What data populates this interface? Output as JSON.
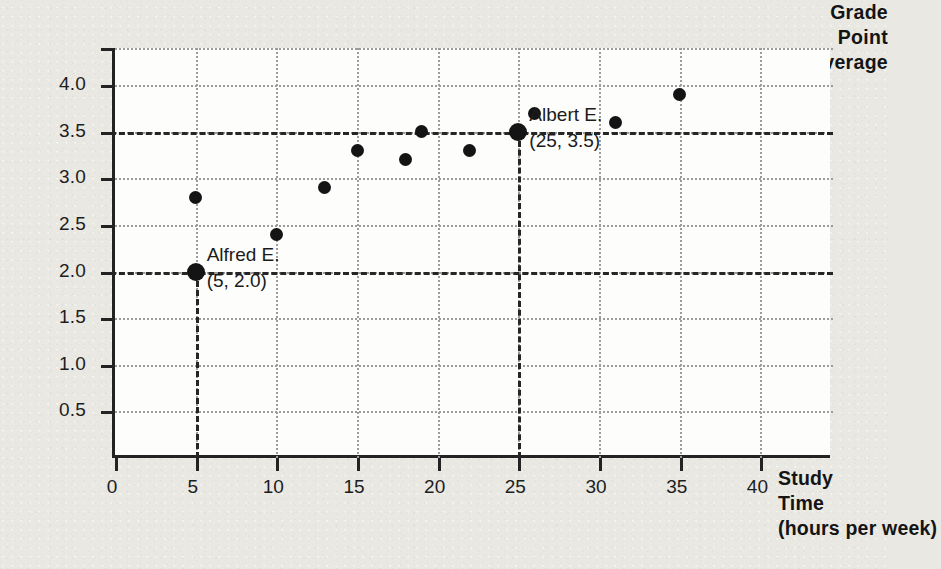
{
  "chart_data": {
    "type": "scatter",
    "title": "",
    "xlabel": "Study Time (hours per week)",
    "ylabel": "Grade Point Average",
    "xlabel_lines": [
      "Study",
      "Time",
      "(hours per week)"
    ],
    "ylabel_lines": [
      "Grade",
      "Point",
      "Average"
    ],
    "xlim": [
      0,
      44.5
    ],
    "ylim": [
      0,
      4.4
    ],
    "xticks": [
      0,
      5,
      10,
      15,
      20,
      25,
      30,
      35,
      40
    ],
    "xticklabels": [
      "0",
      "5",
      "10",
      "15",
      "20",
      "25",
      "30",
      "35",
      "40"
    ],
    "yticks": [
      0.5,
      1.0,
      1.5,
      2.0,
      2.5,
      3.0,
      3.5,
      4.0
    ],
    "yticklabels": [
      "0.5",
      "1.0",
      "1.5",
      "2.0",
      "2.5",
      "3.0",
      "3.5",
      "4.0"
    ],
    "grid": "dotted-both",
    "legend": "none",
    "points": [
      {
        "x": 5,
        "y": 2.8,
        "highlight": false
      },
      {
        "x": 5,
        "y": 2.0,
        "highlight": true
      },
      {
        "x": 10,
        "y": 2.4,
        "highlight": false
      },
      {
        "x": 13,
        "y": 2.9,
        "highlight": false
      },
      {
        "x": 15,
        "y": 3.3,
        "highlight": false
      },
      {
        "x": 18,
        "y": 3.2,
        "highlight": false
      },
      {
        "x": 19,
        "y": 3.5,
        "highlight": false
      },
      {
        "x": 22,
        "y": 3.3,
        "highlight": false
      },
      {
        "x": 25,
        "y": 3.5,
        "highlight": true
      },
      {
        "x": 26,
        "y": 3.7,
        "highlight": false
      },
      {
        "x": 31,
        "y": 3.6,
        "highlight": false
      },
      {
        "x": 35,
        "y": 3.9,
        "highlight": false
      }
    ],
    "reference_lines": [
      {
        "axis": "y",
        "value": 2.0,
        "style": "dash-dot"
      },
      {
        "axis": "y",
        "value": 3.5,
        "style": "dash-dot"
      },
      {
        "axis": "x",
        "value": 5,
        "style": "dashed"
      },
      {
        "axis": "x",
        "value": 25,
        "style": "dashed"
      }
    ],
    "annotations": [
      {
        "name": "Alfred E.",
        "coords": "(5, 2.0)",
        "x": 5,
        "y": 2.0
      },
      {
        "name": "Albert E.",
        "coords": "(25, 3.5)",
        "x": 25,
        "y": 3.5
      }
    ],
    "colors": {
      "background": "#e9e8e3",
      "plot_background": "#fdfdfc",
      "axis": "#232323",
      "grid": "#9c9c9c",
      "marker": "#141414",
      "text": "#1b1b1b"
    }
  }
}
